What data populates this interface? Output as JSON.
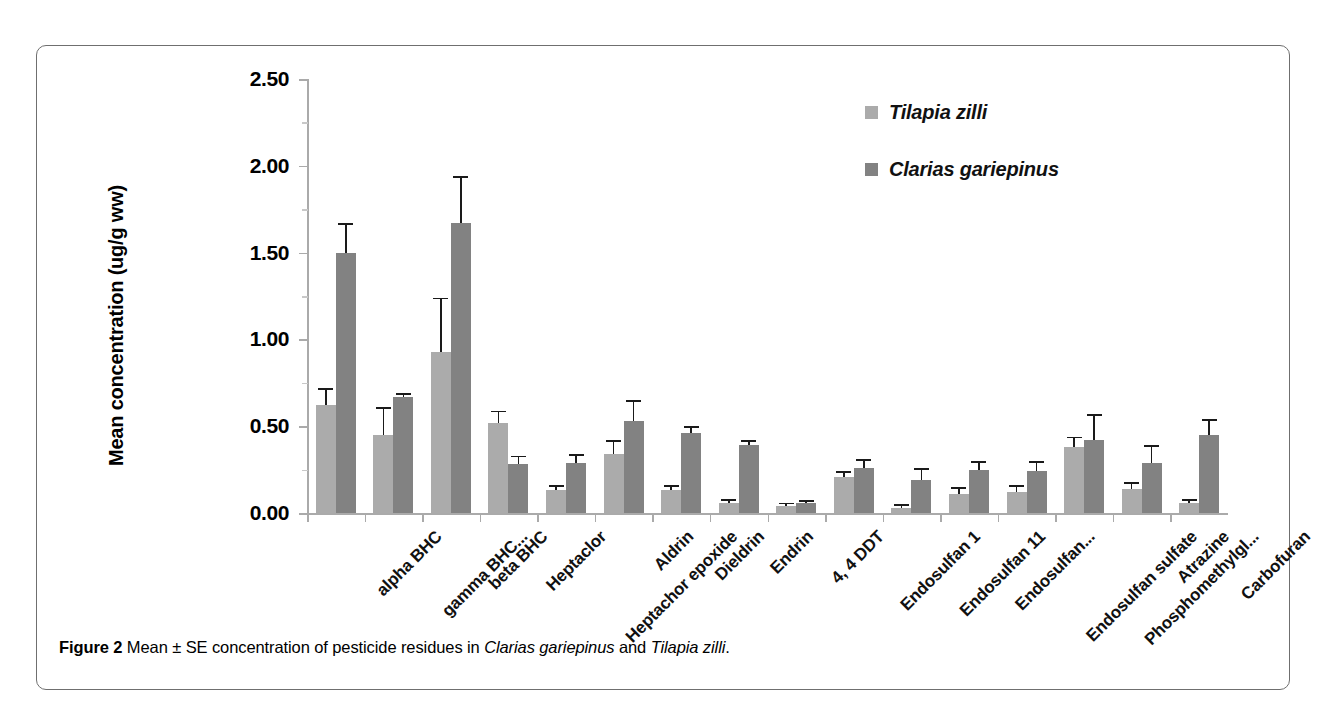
{
  "figure": {
    "caption_number": "Figure 2",
    "caption_part1": " Mean ± SE concentration of pesticide residues in ",
    "caption_species1": "Clarias gariepinus",
    "caption_part2": " and ",
    "caption_species2": "Tilapia zilli",
    "caption_end": "."
  },
  "legend": {
    "position": "top-right",
    "items": [
      {
        "label": "Tilapia zilli",
        "color": "#ababab"
      },
      {
        "label": "Clarias gariepinus",
        "color": "#828282"
      }
    ]
  },
  "chart_data": {
    "type": "bar",
    "title": "",
    "subtitle": "",
    "xlabel": "",
    "ylabel": "Mean concentration (ug/g ww)",
    "ylim": [
      0,
      2.5
    ],
    "ytick_labels": [
      "0.00",
      "0.50",
      "1.00",
      "1.50",
      "2.00",
      "2.50"
    ],
    "ytick_values": [
      0,
      0.5,
      1.0,
      1.5,
      2.0,
      2.5
    ],
    "grid": false,
    "legend_position": "top-right",
    "error_bars": "SE (upper whisker only)",
    "categories": [
      "alpha BHC",
      "gamma BHC...",
      "beta BHC",
      "Heptaclor",
      "Heptachor epoxide",
      "Aldrin",
      "Dieldrin",
      "Endrin",
      "4, 4 DDT",
      "Endosulfan 1",
      "Endosulfan 11",
      "Endosulfan...",
      "Endosulfan sulfate",
      "Phosphomethylgl...",
      "Atrazine",
      "Carbofuran"
    ],
    "series": [
      {
        "name": "Tilapia zilli",
        "color": "#ababab",
        "values": [
          0.62,
          0.45,
          0.93,
          0.52,
          0.13,
          0.34,
          0.13,
          0.06,
          0.04,
          0.21,
          0.03,
          0.11,
          0.12,
          0.38,
          0.14,
          0.06
        ],
        "errors": [
          0.09,
          0.15,
          0.3,
          0.06,
          0.02,
          0.07,
          0.02,
          0.01,
          0.01,
          0.02,
          0.01,
          0.03,
          0.03,
          0.05,
          0.03,
          0.01
        ]
      },
      {
        "name": "Clarias gariepinus",
        "color": "#828282",
        "values": [
          1.5,
          0.67,
          1.67,
          0.28,
          0.29,
          0.53,
          0.46,
          0.39,
          0.055,
          0.26,
          0.19,
          0.25,
          0.24,
          0.42,
          0.29,
          0.45
        ],
        "errors": [
          0.16,
          0.01,
          0.26,
          0.04,
          0.04,
          0.11,
          0.03,
          0.02,
          0.01,
          0.04,
          0.06,
          0.04,
          0.05,
          0.14,
          0.09,
          0.08
        ]
      }
    ]
  }
}
